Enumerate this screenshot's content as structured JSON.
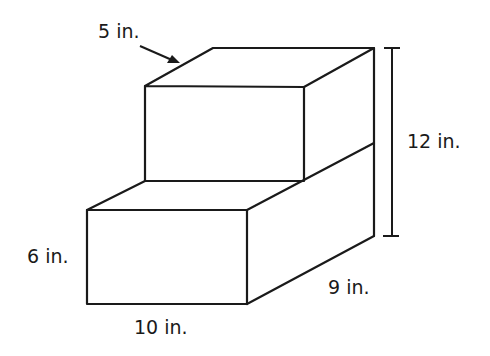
{
  "figure": {
    "type": "composite rectangular prism (stepped solid)",
    "stroke_color": "#1a1a1a",
    "background": "#ffffff"
  },
  "labels": {
    "top_depth": "5 in.",
    "total_height": "12 in.",
    "bottom_height": "6 in.",
    "bottom_width": "10 in.",
    "bottom_depth": "9 in."
  },
  "dimensions": [
    {
      "name": "top_depth",
      "value": 5,
      "unit": "in."
    },
    {
      "name": "total_height",
      "value": 12,
      "unit": "in."
    },
    {
      "name": "bottom_height",
      "value": 6,
      "unit": "in."
    },
    {
      "name": "bottom_width",
      "value": 10,
      "unit": "in."
    },
    {
      "name": "bottom_depth",
      "value": 9,
      "unit": "in."
    }
  ]
}
